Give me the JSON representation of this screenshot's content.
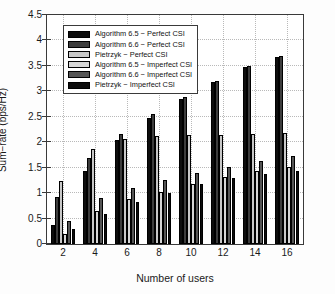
{
  "chart_data": {
    "type": "bar",
    "title": "",
    "xlabel": "Number of users",
    "ylabel": "Sum−rate (bps/Hz)",
    "categories": [
      "2",
      "4",
      "6",
      "8",
      "10",
      "12",
      "14",
      "16"
    ],
    "ylim": [
      0,
      4.5
    ],
    "ytick_step": 0.5,
    "ytick_labels": [
      "0",
      "0.5",
      "1",
      "1.5",
      "2",
      "2.5",
      "3",
      "3.5",
      "4",
      "4.5"
    ],
    "grid": true,
    "legend_position": "upper left",
    "series": [
      {
        "name": "Algorithm 6.5 − Perfect CSI",
        "color": "#0d0d0d",
        "values": [
          0.37,
          1.43,
          2.04,
          2.48,
          2.85,
          3.19,
          3.48,
          3.68
        ]
      },
      {
        "name": "Algorithm 6.6 − Perfect CSI",
        "color": "#3d3d3d",
        "values": [
          0.92,
          1.69,
          2.17,
          2.55,
          2.89,
          3.21,
          3.49,
          3.69
        ]
      },
      {
        "name": "Pietrzyk − Perfect CSI",
        "color": "#c8c8c8",
        "values": [
          1.23,
          1.86,
          2.07,
          2.13,
          2.15,
          2.15,
          2.17,
          2.18
        ]
      },
      {
        "name": "Algorithm 6.5 − Imperfect CSI",
        "color": "#d6d6d6",
        "values": [
          0.19,
          0.65,
          0.88,
          1.03,
          1.18,
          1.32,
          1.43,
          1.52
        ]
      },
      {
        "name": "Algorithm 6.6 − Imperfect CSI",
        "color": "#555555",
        "values": [
          0.46,
          0.9,
          1.11,
          1.25,
          1.39,
          1.52,
          1.63,
          1.72
        ]
      },
      {
        "name": "Pietrzyk − Imperfect CSI",
        "color": "#0d0d0d",
        "values": [
          0.3,
          0.59,
          0.82,
          1.01,
          1.17,
          1.29,
          1.38,
          1.43
        ]
      }
    ]
  }
}
